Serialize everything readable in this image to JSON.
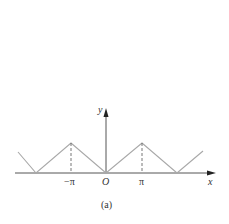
{
  "figure": {
    "caption": "(a)",
    "axes": {
      "x_label": "x",
      "y_label": "y",
      "origin_label": "O",
      "ticks": [
        "−π",
        "π"
      ]
    },
    "curve": {
      "description": "periodic triangle wave |x| with period 2π",
      "color": "#a0a0a0",
      "points": [
        [
          -4.5,
          1.5
        ],
        [
          -6.28,
          0
        ],
        [
          -3.14,
          3.14
        ],
        [
          0,
          0
        ],
        [
          3.14,
          3.14
        ],
        [
          6.28,
          0
        ],
        [
          8.2,
          1.9
        ]
      ]
    },
    "dashed_guides": [
      "x = −π",
      "x = π"
    ]
  }
}
